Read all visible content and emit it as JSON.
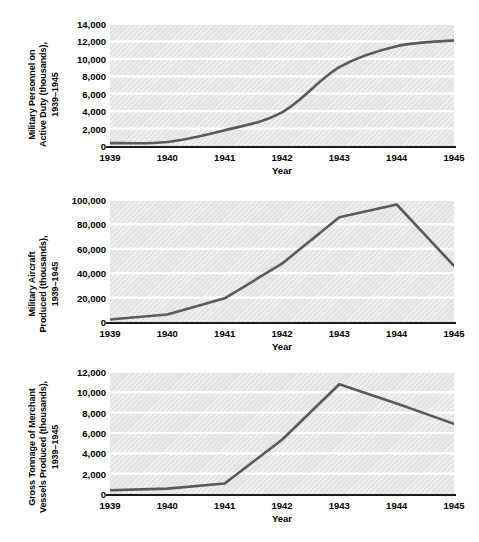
{
  "figure": {
    "background_color": "#ffffff",
    "line_color": "#5a5a5a",
    "plot_background_color": "#e4e4e4",
    "gridline_color": "#ffffff",
    "axis_color": "#1a1a1a"
  },
  "chart_data": [
    {
      "type": "line",
      "title": "",
      "ylabel": "Military Personnel on Active Duty (thousands), 1939–1945",
      "xlabel": "Year",
      "categories": [
        "1939",
        "1940",
        "1941",
        "1942",
        "1943",
        "1944",
        "1945"
      ],
      "x": [
        1939,
        1940,
        1941,
        1942,
        1943,
        1944,
        1945
      ],
      "values": [
        334,
        458,
        1801,
        3859,
        9045,
        11452,
        12123
      ],
      "ylim": [
        0,
        14000
      ],
      "xlim": [
        1939,
        1945
      ],
      "yticks": [
        0,
        2000,
        4000,
        6000,
        8000,
        10000,
        12000,
        14000
      ],
      "ytick_labels": [
        "0",
        "2,000",
        "4,000",
        "6,000",
        "8,000",
        "10,000",
        "12,000",
        "14,000"
      ],
      "grid": true,
      "legend": "none",
      "smooth": true
    },
    {
      "type": "line",
      "title": "",
      "ylabel": "Military Aircraft Produced (thousands), 1939–1945",
      "xlabel": "Year",
      "categories": [
        "1939",
        "1940",
        "1941",
        "1942",
        "1943",
        "1944",
        "1945"
      ],
      "x": [
        1939,
        1940,
        1941,
        1942,
        1943,
        1944,
        1945
      ],
      "values": [
        2100,
        6100,
        19400,
        47800,
        85900,
        96300,
        46000
      ],
      "ylim": [
        0,
        100000
      ],
      "xlim": [
        1939,
        1945
      ],
      "yticks": [
        0,
        20000,
        40000,
        60000,
        80000,
        100000
      ],
      "ytick_labels": [
        "0",
        "20,000",
        "40,000",
        "60,000",
        "80,000",
        "100,000"
      ],
      "grid": true,
      "legend": "none",
      "smooth": false
    },
    {
      "type": "line",
      "title": "",
      "ylabel": "Gross Tonnage of Merchant Vessels Produced (thousands), 1939–1945",
      "xlabel": "Year",
      "categories": [
        "1939",
        "1940",
        "1941",
        "1942",
        "1943",
        "1944",
        "1945"
      ],
      "x": [
        1939,
        1940,
        1941,
        1942,
        1943,
        1944,
        1945
      ],
      "values": [
        376,
        528,
        1031,
        5339,
        10800,
        8900,
        6900
      ],
      "ylim": [
        0,
        12000
      ],
      "xlim": [
        1939,
        1945
      ],
      "yticks": [
        0,
        2000,
        4000,
        6000,
        8000,
        10000,
        12000
      ],
      "ytick_labels": [
        "0",
        "2,000",
        "4,000",
        "6,000",
        "8,000",
        "10,000",
        "12,000"
      ],
      "grid": true,
      "legend": "none",
      "smooth": false
    }
  ],
  "charts": [
    {
      "ylabel_lines": [
        "Military Personnel on",
        "Active Duty (thousands),",
        "1939–1945"
      ]
    },
    {
      "ylabel_lines": [
        "Military Aircraft",
        "Produced (thousands),",
        "1939–1945"
      ]
    },
    {
      "ylabel_lines": [
        "Gross Tonnage of Merchant",
        "Vessels Produced (thousands),",
        "1939–1945"
      ]
    }
  ]
}
